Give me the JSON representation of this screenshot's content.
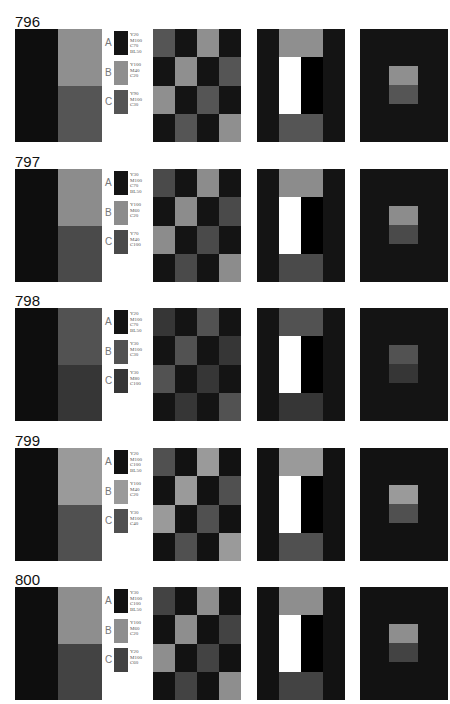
{
  "plates": [
    {
      "number": "796",
      "colors": {
        "A": "#141414",
        "B": "#8f8f8f",
        "C": "#555555",
        "black": "#0e0e0e"
      },
      "swatches": [
        {
          "letter": "A",
          "spec": "Y20\nM100\nC70\nBL50"
        },
        {
          "letter": "B",
          "spec": "Y100\nM40\nC20"
        },
        {
          "letter": "C",
          "spec": "Y90\nM100\nC30"
        }
      ]
    },
    {
      "number": "797",
      "colors": {
        "A": "#141414",
        "B": "#8c8c8c",
        "C": "#4a4a4a",
        "black": "#0e0e0e"
      },
      "swatches": [
        {
          "letter": "A",
          "spec": "Y30\nM100\nC70\nBL50"
        },
        {
          "letter": "B",
          "spec": "Y100\nM60\nC20"
        },
        {
          "letter": "C",
          "spec": "Y70\nM40\nC100"
        }
      ]
    },
    {
      "number": "798",
      "colors": {
        "A": "#141414",
        "B": "#525252",
        "C": "#363636",
        "black": "#0e0e0e"
      },
      "swatches": [
        {
          "letter": "A",
          "spec": "Y20\nM100\nC70\nBL50"
        },
        {
          "letter": "B",
          "spec": "Y30\nM100\nC30"
        },
        {
          "letter": "C",
          "spec": "Y30\nM80\nC100"
        }
      ]
    },
    {
      "number": "799",
      "colors": {
        "A": "#121212",
        "B": "#9a9a9a",
        "C": "#505050",
        "black": "#0e0e0e"
      },
      "swatches": [
        {
          "letter": "A",
          "spec": "Y20\nM100\nC100\nBL50"
        },
        {
          "letter": "B",
          "spec": "Y100\nM40\nC20"
        },
        {
          "letter": "C",
          "spec": "Y30\nM100\nC40"
        }
      ]
    },
    {
      "number": "800",
      "colors": {
        "A": "#121212",
        "B": "#8e8e8e",
        "C": "#434343",
        "black": "#0e0e0e"
      },
      "swatches": [
        {
          "letter": "A",
          "spec": "Y30\nM100\nC100\nBL50"
        },
        {
          "letter": "B",
          "spec": "Y100\nM60\nC20"
        },
        {
          "letter": "C",
          "spec": "Y20\nM100\nC60"
        }
      ]
    }
  ],
  "layout": {
    "block_tops": [
      29,
      169,
      308,
      448,
      587
    ],
    "checker_pattern": [
      [
        "C",
        "A",
        "B",
        "A"
      ],
      [
        "A",
        "B",
        "A",
        "C"
      ],
      [
        "B",
        "A",
        "C",
        "A"
      ],
      [
        "A",
        "C",
        "A",
        "B"
      ]
    ]
  }
}
